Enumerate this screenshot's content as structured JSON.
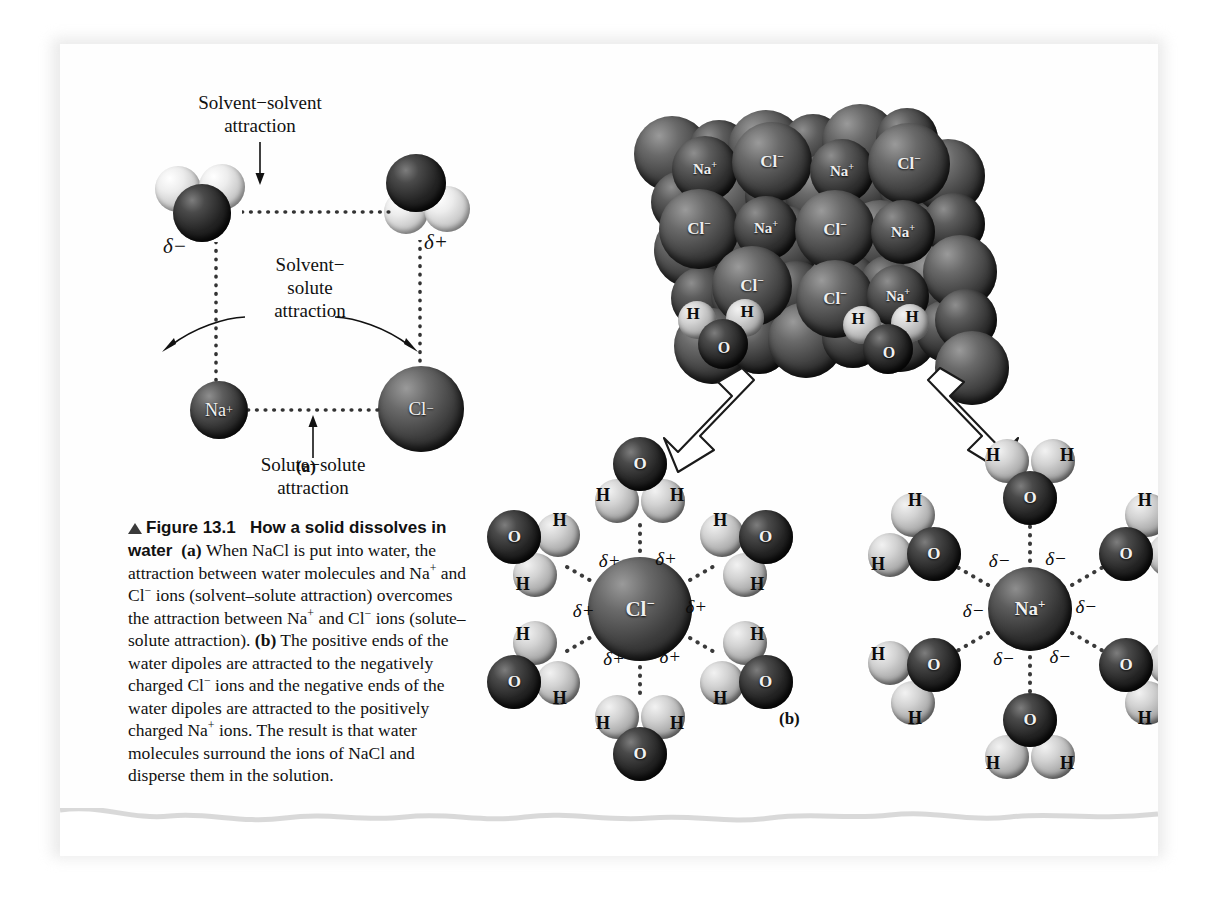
{
  "figure": {
    "number": "Figure 13.1",
    "title": "How a solid dissolves in water",
    "panel_a_label": "(a)",
    "panel_b_label": "(b)",
    "caption_segments": {
      "marker": "▲",
      "fig_number": "Figure 13.1",
      "bold_title": "How a solid dissolves in water",
      "a_tag": "(a)",
      "body_a_1": "When NaCl is put into water, the attraction between water molecules and Na",
      "body_a_sup1": "+",
      "body_a_2": " and Cl",
      "body_a_sup2": "−",
      "body_a_3": " ions (solvent–solute attraction) overcomes the attraction between Na",
      "body_a_sup3": "+",
      "body_a_4": " and Cl",
      "body_a_sup4": "−",
      "body_a_5": " ions (solute–solute attraction). ",
      "b_tag": "(b)",
      "body_b_1": " The positive ends of the water dipoles are attracted to the negatively charged Cl",
      "body_b_sup1": "−",
      "body_b_2": " ions and the negative ends of the water dipoles are attracted to the positively charged Na",
      "body_b_sup2": "+",
      "body_b_3": " ions. The result is that water molecules surround the ions of NaCl and disperse them in the solution."
    }
  },
  "panel_a": {
    "annotations": [
      {
        "id": "solvent-solvent",
        "line1": "Solvent−solvent",
        "line2": "attraction"
      },
      {
        "id": "solvent-solute",
        "line1": "Solvent−",
        "line2": "solute",
        "line3": "attraction"
      },
      {
        "id": "solute-solute",
        "line1": "Solute−solute",
        "line2": "attraction"
      }
    ],
    "partial_charges": [
      {
        "id": "delta-minus-left",
        "text": "δ−"
      },
      {
        "id": "delta-plus-right",
        "text": "δ+"
      }
    ],
    "ions": [
      {
        "id": "sodium-ion",
        "label": "Na",
        "charge": "+"
      },
      {
        "id": "chloride-ion",
        "label": "Cl",
        "charge": "−"
      }
    ],
    "water_molecules": [
      {
        "id": "water-left",
        "atoms": [
          "H",
          "O",
          "H"
        ],
        "orientation": "oxygen-down"
      },
      {
        "id": "water-right",
        "atoms": [
          "H",
          "O",
          "H"
        ],
        "orientation": "oxygen-up"
      }
    ]
  },
  "panel_b": {
    "crystal": {
      "name": "NaCl crystal lattice",
      "visible_ion_labels": [
        {
          "text": "Na",
          "charge": "+",
          "x": 645,
          "y": 125,
          "r": 33,
          "shade": "na"
        },
        {
          "text": "Cl",
          "charge": "−",
          "x": 712,
          "y": 118,
          "r": 40,
          "shade": "cl"
        },
        {
          "text": "Na",
          "charge": "+",
          "x": 782,
          "y": 127,
          "r": 32,
          "shade": "na"
        },
        {
          "text": "Cl",
          "charge": "−",
          "x": 849,
          "y": 120,
          "r": 41,
          "shade": "cl"
        },
        {
          "text": "Cl",
          "charge": "−",
          "x": 639,
          "y": 185,
          "r": 40,
          "shade": "cl"
        },
        {
          "text": "Na",
          "charge": "+",
          "x": 706,
          "y": 184,
          "r": 32,
          "shade": "na"
        },
        {
          "text": "Cl",
          "charge": "−",
          "x": 775,
          "y": 186,
          "r": 40,
          "shade": "cl"
        },
        {
          "text": "Na",
          "charge": "+",
          "x": 843,
          "y": 188,
          "r": 32,
          "shade": "na"
        },
        {
          "text": "Cl",
          "charge": "−",
          "x": 692,
          "y": 242,
          "r": 40,
          "shade": "cl"
        },
        {
          "text": "Cl",
          "charge": "−",
          "x": 775,
          "y": 255,
          "r": 39,
          "shade": "cl"
        },
        {
          "text": "Na",
          "charge": "+",
          "x": 838,
          "y": 252,
          "r": 31,
          "shade": "na"
        }
      ],
      "surface_waters": [
        {
          "id": "surface-water-left",
          "h1": "H",
          "o": "O",
          "h2": "H"
        },
        {
          "id": "surface-water-right",
          "h1": "H",
          "o": "O",
          "h2": "H"
        }
      ]
    },
    "arrows": [
      {
        "id": "arrow-to-chloride-cluster",
        "direction": "down-left"
      },
      {
        "id": "arrow-to-sodium-cluster",
        "direction": "down-right"
      }
    ],
    "chloride_cluster": {
      "center_ion": {
        "label": "Cl",
        "charge": "−"
      },
      "charge_label": "δ+",
      "water_count": 6,
      "waters": [
        {
          "id": "cl-water-top",
          "angle": -90,
          "atoms": [
            "H",
            "O",
            "H"
          ]
        },
        {
          "id": "cl-water-upper-right",
          "angle": -30,
          "atoms": [
            "H",
            "O",
            "H"
          ]
        },
        {
          "id": "cl-water-lower-right",
          "angle": 30,
          "atoms": [
            "H",
            "O",
            "H"
          ]
        },
        {
          "id": "cl-water-bottom",
          "angle": 90,
          "atoms": [
            "H",
            "O",
            "H"
          ]
        },
        {
          "id": "cl-water-lower-left",
          "angle": 150,
          "atoms": [
            "H",
            "O",
            "H"
          ]
        },
        {
          "id": "cl-water-upper-left",
          "angle": 210,
          "atoms": [
            "H",
            "O",
            "H"
          ]
        }
      ]
    },
    "sodium_cluster": {
      "center_ion": {
        "label": "Na",
        "charge": "+"
      },
      "charge_label": "δ−",
      "water_count": 6,
      "waters": [
        {
          "id": "na-water-top",
          "angle": -90,
          "atoms": [
            "H",
            "O",
            "H"
          ]
        },
        {
          "id": "na-water-upper-right",
          "angle": -30,
          "atoms": [
            "H",
            "O",
            "H"
          ]
        },
        {
          "id": "na-water-lower-right",
          "angle": 30,
          "atoms": [
            "H",
            "O",
            "H"
          ]
        },
        {
          "id": "na-water-bottom",
          "angle": 90,
          "atoms": [
            "H",
            "O",
            "H"
          ]
        },
        {
          "id": "na-water-lower-left",
          "angle": 150,
          "atoms": [
            "H",
            "O",
            "H"
          ]
        },
        {
          "id": "na-water-upper-left",
          "angle": 210,
          "atoms": [
            "H",
            "O",
            "H"
          ]
        }
      ]
    }
  },
  "colors": {
    "page": "#fefefe",
    "background": "#ffffff",
    "text": "#111111",
    "oxygen": "#1a1a1a",
    "hydrogen": "#d8d8d8",
    "sodium": "#2f2f2f",
    "chloride": "#444444",
    "dotted_line": "#4a4a4a"
  }
}
